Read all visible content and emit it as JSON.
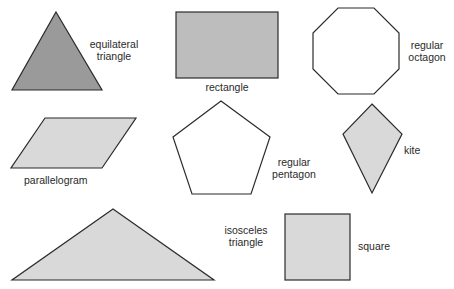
{
  "diagram": {
    "colors": {
      "stroke": "#2b2b2b",
      "dark_fill": "#9a9a9a",
      "medium_fill": "#bdbdbd",
      "light_fill": "#d9d9d9",
      "white_fill": "#ffffff"
    },
    "shapes": [
      {
        "id": "equilateral-triangle",
        "label_line1": "equilateral",
        "label_line2": "triangle",
        "fill": "dark"
      },
      {
        "id": "rectangle",
        "label_line1": "rectangle",
        "fill": "medium"
      },
      {
        "id": "regular-octagon",
        "label_line1": "regular",
        "label_line2": "octagon",
        "fill": "white"
      },
      {
        "id": "parallelogram",
        "label_line1": "parallelogram",
        "fill": "light"
      },
      {
        "id": "regular-pentagon",
        "label_line1": "regular",
        "label_line2": "pentagon",
        "fill": "white"
      },
      {
        "id": "kite",
        "label_line1": "kite",
        "fill": "light"
      },
      {
        "id": "isosceles-triangle",
        "label_line1": "isosceles",
        "label_line2": "triangle",
        "fill": "light"
      },
      {
        "id": "square",
        "label_line1": "square",
        "fill": "light"
      }
    ]
  }
}
